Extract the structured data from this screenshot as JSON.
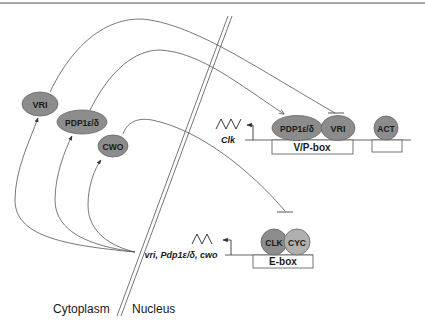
{
  "diagram": {
    "colors": {
      "protein_dark": "#8c8c8c",
      "protein_light": "#b0b0b0",
      "line": "#555555",
      "membrane": "#666666",
      "background": "#ffffff"
    },
    "cytoplasm_proteins": [
      {
        "id": "vri",
        "label": "VRI"
      },
      {
        "id": "pdp1",
        "label": "PDP1ε/δ"
      },
      {
        "id": "cwo",
        "label": "CWO"
      }
    ],
    "nuclear_complexes": {
      "vp_box": {
        "label": "V/P-box",
        "proteins": [
          {
            "id": "pdp1",
            "label": "PDP1ε/δ"
          },
          {
            "id": "vri",
            "label": "VRI"
          }
        ],
        "target_gene": "Clk"
      },
      "act_box": {
        "proteins": [
          {
            "id": "act",
            "label": "ACT"
          }
        ]
      },
      "e_box": {
        "label": "E-box",
        "proteins": [
          {
            "id": "clk",
            "label": "CLK"
          },
          {
            "id": "cyc",
            "label": "CYC"
          }
        ],
        "target_genes": "vri, Pdp1ε/δ, cwo"
      }
    },
    "compartments": {
      "left": "Cytoplasm",
      "right": "Nucleus"
    },
    "interactions": [
      {
        "from": "VRI (cytoplasm)",
        "to": "VRI (V/P-box)",
        "type": "inhibition"
      },
      {
        "from": "PDP1ε/δ (cytoplasm)",
        "to": "PDP1ε/δ (V/P-box)",
        "type": "activation"
      },
      {
        "from": "CWO (cytoplasm)",
        "to": "CLK/CYC (E-box)",
        "type": "inhibition"
      },
      {
        "from": "vri, Pdp1ε/δ, cwo",
        "to": "VRI",
        "type": "translation"
      },
      {
        "from": "vri, Pdp1ε/δ, cwo",
        "to": "PDP1ε/δ",
        "type": "translation"
      },
      {
        "from": "vri, Pdp1ε/δ, cwo",
        "to": "CWO",
        "type": "translation"
      }
    ]
  }
}
